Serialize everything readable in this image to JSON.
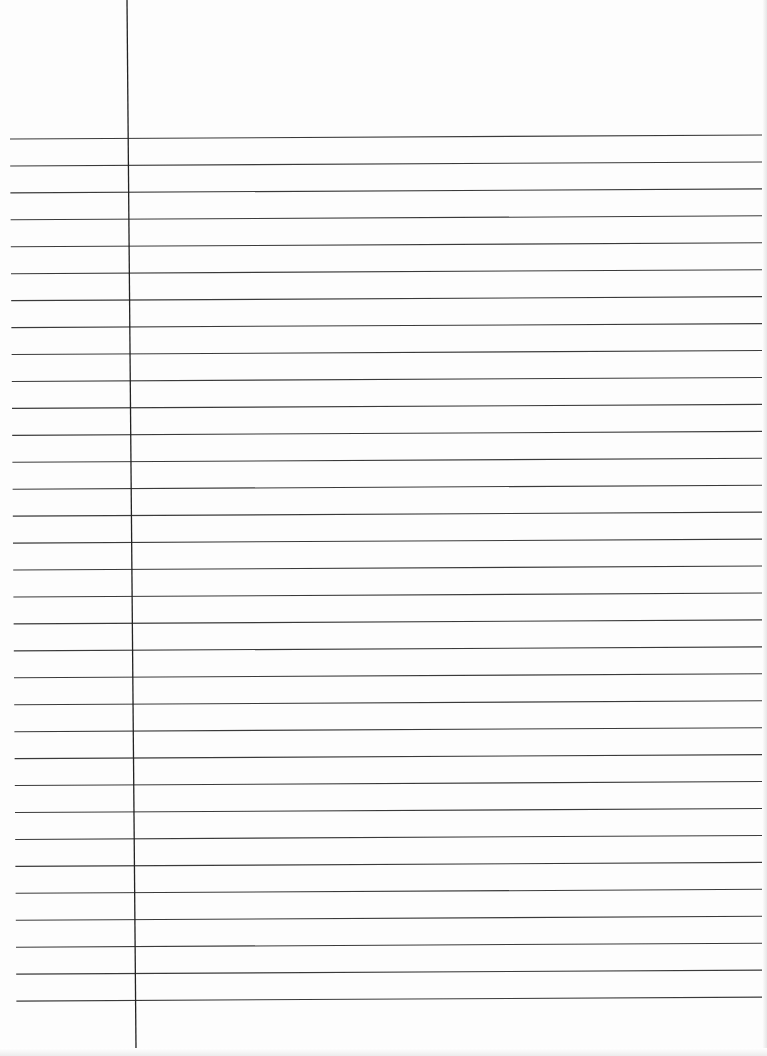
{
  "paper": {
    "type": "lined-paper",
    "background": "#fdfdfd",
    "line_color": "#3a3a3a",
    "margin_line_color": "#222222",
    "line_count": 33,
    "line_spacing_px": 27,
    "first_line_left_y": 139,
    "first_line_right_y": 135,
    "line_left_x": 10,
    "line_right_x": 763,
    "margin_line": {
      "top_x": 127,
      "top_y": 0,
      "bottom_x": 136,
      "bottom_y": 1048
    }
  }
}
